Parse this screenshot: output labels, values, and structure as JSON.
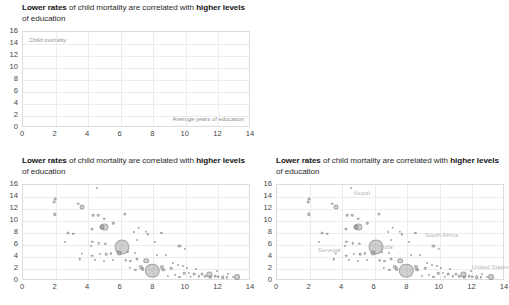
{
  "panels": [
    {
      "id": "panel-empty",
      "title_parts": [
        "Lower rates",
        " of child mortality are correlated with ",
        "higher levels",
        " of education"
      ],
      "show_axis_notes": true,
      "show_points": false
    },
    {
      "id": "panel-blank",
      "blank": true
    },
    {
      "id": "panel-scatter",
      "title_parts": [
        "Lower rates",
        " of child mortality are correlated with ",
        "higher levels",
        " of education"
      ],
      "show_axis_notes": false,
      "show_points": true,
      "show_labels": false
    },
    {
      "id": "panel-labeled",
      "title_parts": [
        "Lower rates",
        " of child mortality are correlated with ",
        "higher levels",
        " of education"
      ],
      "show_axis_notes": false,
      "show_points": true,
      "show_labels": true
    }
  ],
  "axis_notes": {
    "y": "Child mortality",
    "x": "Average years of education"
  },
  "colors": {
    "bubble_fill": "rgba(128,128,128,0.38)",
    "grid": "#ececec",
    "frame": "#dcdcdc",
    "title": "#2b2b2b",
    "label": "#b8b8b8"
  },
  "chart_data": {
    "type": "scatter",
    "title": "Lower rates of child mortality are correlated with higher levels of education",
    "xlabel": "Average years of education",
    "ylabel": "Child mortality",
    "xlim": [
      0,
      14
    ],
    "ylim": [
      0,
      16
    ],
    "xticks": [
      0,
      2,
      4,
      6,
      8,
      10,
      12,
      14
    ],
    "yticks": [
      0,
      2,
      4,
      6,
      8,
      10,
      12,
      14,
      16
    ],
    "grid": true,
    "legend": "none",
    "size_encodes": "population",
    "annotations": [
      {
        "label": "Nepal",
        "x": 5.2,
        "y": 14.6
      },
      {
        "label": "Senegal",
        "x": 3.2,
        "y": 5.2
      },
      {
        "label": "India",
        "x": 6.7,
        "y": 5.6
      },
      {
        "label": "South Africa",
        "x": 10.1,
        "y": 7.6
      },
      {
        "label": "United States",
        "x": 13.1,
        "y": 2.3
      }
    ],
    "points": [
      {
        "x": 1.95,
        "y": 13.6,
        "r": 1.4
      },
      {
        "x": 1.9,
        "y": 13.2,
        "r": 1.4
      },
      {
        "x": 1.95,
        "y": 11.1,
        "r": 1.7
      },
      {
        "x": 3.4,
        "y": 12.9,
        "r": 1.3
      },
      {
        "x": 3.65,
        "y": 12.3,
        "r": 2.4
      },
      {
        "x": 4.55,
        "y": 15.5,
        "r": 1.0
      },
      {
        "x": 4.3,
        "y": 11.0,
        "r": 1.3
      },
      {
        "x": 4.6,
        "y": 11.0,
        "r": 1.3
      },
      {
        "x": 5.0,
        "y": 10.4,
        "r": 1.3
      },
      {
        "x": 5.55,
        "y": 9.6,
        "r": 1.2
      },
      {
        "x": 5.0,
        "y": 9.0,
        "r": 3.6
      },
      {
        "x": 4.85,
        "y": 9.05,
        "r": 2.6
      },
      {
        "x": 4.25,
        "y": 8.7,
        "r": 1.6
      },
      {
        "x": 6.25,
        "y": 11.2,
        "r": 1.6
      },
      {
        "x": 2.75,
        "y": 8.0,
        "r": 1.5
      },
      {
        "x": 3.1,
        "y": 7.9,
        "r": 1.3
      },
      {
        "x": 2.6,
        "y": 6.5,
        "r": 1.0
      },
      {
        "x": 4.25,
        "y": 6.5,
        "r": 1.2
      },
      {
        "x": 4.2,
        "y": 5.9,
        "r": 1.0
      },
      {
        "x": 4.65,
        "y": 6.3,
        "r": 1.3
      },
      {
        "x": 5.05,
        "y": 6.2,
        "r": 1.2
      },
      {
        "x": 6.05,
        "y": 5.7,
        "r": 7.5
      },
      {
        "x": 5.9,
        "y": 4.7,
        "r": 2.4
      },
      {
        "x": 3.6,
        "y": 4.5,
        "r": 1.2
      },
      {
        "x": 4.25,
        "y": 4.2,
        "r": 1.3
      },
      {
        "x": 4.7,
        "y": 4.5,
        "r": 1.1
      },
      {
        "x": 5.1,
        "y": 4.5,
        "r": 1.3
      },
      {
        "x": 5.4,
        "y": 4.6,
        "r": 1.1
      },
      {
        "x": 3.5,
        "y": 3.6,
        "r": 1.2
      },
      {
        "x": 4.45,
        "y": 3.5,
        "r": 1.0
      },
      {
        "x": 5.0,
        "y": 3.3,
        "r": 1.0
      },
      {
        "x": 5.5,
        "y": 3.5,
        "r": 1.0
      },
      {
        "x": 6.3,
        "y": 3.5,
        "r": 1.3
      },
      {
        "x": 6.6,
        "y": 3.3,
        "r": 1.1
      },
      {
        "x": 7.0,
        "y": 3.6,
        "r": 1.5
      },
      {
        "x": 7.55,
        "y": 3.4,
        "r": 2.8
      },
      {
        "x": 7.1,
        "y": 8.9,
        "r": 1.3
      },
      {
        "x": 7.55,
        "y": 8.2,
        "r": 1.2
      },
      {
        "x": 7.65,
        "y": 7.8,
        "r": 1.2
      },
      {
        "x": 8.5,
        "y": 8.0,
        "r": 1.1
      },
      {
        "x": 6.8,
        "y": 8.1,
        "r": 1.0
      },
      {
        "x": 9.6,
        "y": 5.85,
        "r": 1.6
      },
      {
        "x": 9.95,
        "y": 5.4,
        "r": 1.2
      },
      {
        "x": 6.55,
        "y": 2.2,
        "r": 1.2
      },
      {
        "x": 6.9,
        "y": 1.9,
        "r": 1.1
      },
      {
        "x": 7.25,
        "y": 2.4,
        "r": 2.1
      },
      {
        "x": 7.35,
        "y": 2.0,
        "r": 1.9
      },
      {
        "x": 7.95,
        "y": 1.7,
        "r": 7.2
      },
      {
        "x": 8.55,
        "y": 2.4,
        "r": 2.0
      },
      {
        "x": 8.6,
        "y": 1.9,
        "r": 1.8
      },
      {
        "x": 9.1,
        "y": 2.1,
        "r": 1.3
      },
      {
        "x": 8.9,
        "y": 0.8,
        "r": 1.1
      },
      {
        "x": 9.35,
        "y": 1.0,
        "r": 1.0
      },
      {
        "x": 9.6,
        "y": 0.7,
        "r": 1.1
      },
      {
        "x": 9.9,
        "y": 1.3,
        "r": 1.2
      },
      {
        "x": 10.2,
        "y": 1.4,
        "r": 1.1
      },
      {
        "x": 10.3,
        "y": 0.7,
        "r": 1.3
      },
      {
        "x": 10.5,
        "y": 1.1,
        "r": 1.4
      },
      {
        "x": 10.8,
        "y": 0.8,
        "r": 1.2
      },
      {
        "x": 11.0,
        "y": 1.2,
        "r": 1.5
      },
      {
        "x": 11.2,
        "y": 0.8,
        "r": 1.2
      },
      {
        "x": 11.45,
        "y": 1.1,
        "r": 2.6
      },
      {
        "x": 11.5,
        "y": 0.6,
        "r": 1.2
      },
      {
        "x": 11.8,
        "y": 0.8,
        "r": 1.3
      },
      {
        "x": 12.0,
        "y": 0.7,
        "r": 1.2
      },
      {
        "x": 12.25,
        "y": 0.65,
        "r": 1.8
      },
      {
        "x": 12.5,
        "y": 0.6,
        "r": 1.2
      },
      {
        "x": 12.9,
        "y": 0.7,
        "r": 1.0
      },
      {
        "x": 13.15,
        "y": 0.7,
        "r": 3.0
      },
      {
        "x": 10.1,
        "y": 2.2,
        "r": 1.0
      },
      {
        "x": 9.85,
        "y": 2.5,
        "r": 1.0
      },
      {
        "x": 8.2,
        "y": 4.4,
        "r": 1.0
      },
      {
        "x": 8.8,
        "y": 4.3,
        "r": 1.0
      },
      {
        "x": 6.85,
        "y": 4.6,
        "r": 1.0
      },
      {
        "x": 6.45,
        "y": 4.9,
        "r": 1.0
      },
      {
        "x": 10.6,
        "y": 2.0,
        "r": 1.0
      },
      {
        "x": 9.2,
        "y": 3.0,
        "r": 1.0
      },
      {
        "x": 9.5,
        "y": 2.7,
        "r": 1.0
      },
      {
        "x": 8.1,
        "y": 6.5,
        "r": 1.0
      },
      {
        "x": 7.0,
        "y": 6.9,
        "r": 1.0
      },
      {
        "x": 11.9,
        "y": 1.6,
        "r": 1.0
      },
      {
        "x": 12.6,
        "y": 1.2,
        "r": 1.0
      }
    ]
  }
}
